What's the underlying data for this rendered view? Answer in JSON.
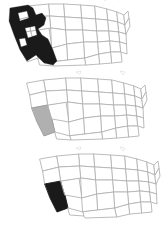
{
  "figure": {
    "type": "map-series",
    "canvas": {
      "width": 162,
      "height": 229,
      "background": "#ffffff"
    },
    "colors": {
      "state_border": "#b3b3b3",
      "state_fill": "#ffffff",
      "highlight_black": "#1a1a1a",
      "highlight_gray": "#b0b0b0"
    },
    "panels": [
      {
        "id": "map-top",
        "order": 1,
        "offset_x": 5,
        "offset_y": 2,
        "highlight_style": "black",
        "highlight_label": "West Coast block",
        "highlighted_states": [
          "Washington",
          "Oregon",
          "California",
          "Nevada"
        ],
        "note": "Large solid black western region with white interior holes"
      },
      {
        "id": "map-middle",
        "order": 2,
        "offset_x": 22,
        "offset_y": 76,
        "highlight_style": "gray",
        "highlight_label": "California",
        "highlighted_states": [
          "California"
        ],
        "note": "California filled medium gray, all other states white"
      },
      {
        "id": "map-bottom",
        "order": 3,
        "offset_x": 35,
        "offset_y": 152,
        "highlight_style": "black",
        "highlight_label": "California",
        "highlighted_states": [
          "California"
        ],
        "note": "California filled solid black, all other states white"
      }
    ],
    "labels": [],
    "legend": null,
    "title": ""
  }
}
